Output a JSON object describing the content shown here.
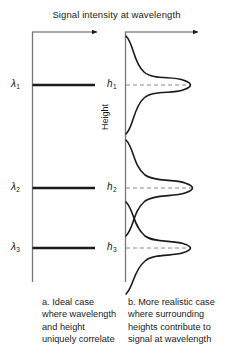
{
  "figure": {
    "title": "Signal intensity at wavelength",
    "height_axis_label": "Height",
    "left_panel": {
      "name": "ideal-case-panel",
      "caption": "a. Ideal case where wavelength and height uniquely correlate",
      "tick_labels": [
        "λ",
        "λ",
        "λ"
      ],
      "tick_subscripts": [
        "1",
        "2",
        "3"
      ],
      "bars": [
        {
          "label": "λ1",
          "y": 85,
          "length": 63
        },
        {
          "label": "λ2",
          "y": 188,
          "length": 63
        },
        {
          "label": "λ3",
          "y": 248,
          "length": 63
        }
      ]
    },
    "right_panel": {
      "name": "realistic-case-panel",
      "caption": "b. More realistic case where surrounding heights contribute to signal at wavelength",
      "tick_labels": [
        "h",
        "h",
        "h"
      ],
      "tick_subscripts": [
        "1",
        "2",
        "3"
      ],
      "peaks": [
        {
          "label": "h1",
          "center_y": 85,
          "amplitude": 66,
          "width": 26
        },
        {
          "label": "h2",
          "center_y": 188,
          "amplitude": 68,
          "width": 24
        },
        {
          "label": "h3",
          "center_y": 248,
          "amplitude": 66,
          "width": 24
        }
      ]
    },
    "colors": {
      "line": "#1a1a1a",
      "axis": "#555555",
      "dashed_guide": "#777777",
      "background": "#ffffff"
    }
  }
}
